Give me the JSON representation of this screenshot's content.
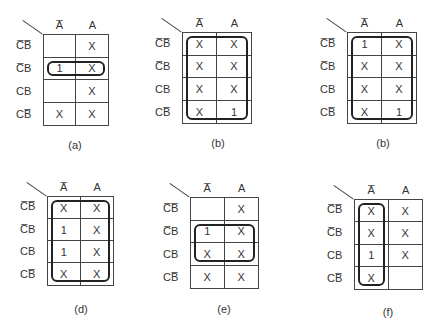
{
  "column_headers": [
    "A̅",
    "A"
  ],
  "row_headers": [
    "C̅B̅",
    "C̅B",
    "CB",
    "CB̅"
  ],
  "maps": [
    {
      "caption": "(a)",
      "cells": [
        [
          "",
          "X"
        ],
        [
          "1",
          "X"
        ],
        [
          "",
          "X"
        ],
        [
          "X",
          "X"
        ]
      ],
      "group": "row C̅B, both columns"
    },
    {
      "caption": "(b)",
      "cells": [
        [
          "X",
          "X"
        ],
        [
          "X",
          "X"
        ],
        [
          "X",
          "X"
        ],
        [
          "X",
          "1"
        ]
      ],
      "group": "all cells"
    },
    {
      "caption": "(b)",
      "cells": [
        [
          "1",
          "X"
        ],
        [
          "X",
          "X"
        ],
        [
          "X",
          "X"
        ],
        [
          "X",
          "1"
        ]
      ],
      "group": "all cells"
    },
    {
      "caption": "(d)",
      "cells": [
        [
          "X",
          "X"
        ],
        [
          "1",
          "X"
        ],
        [
          "1",
          "X"
        ],
        [
          "X",
          "X"
        ]
      ],
      "group": "all cells"
    },
    {
      "caption": "(e)",
      "cells": [
        [
          "",
          "X"
        ],
        [
          "1",
          "X"
        ],
        [
          "X",
          "X"
        ],
        [
          "X",
          "X"
        ]
      ],
      "group": "rows C̅B and CB, both columns"
    },
    {
      "caption": "(f)",
      "cells": [
        [
          "X",
          "X"
        ],
        [
          "X",
          "X"
        ],
        [
          "1",
          "X"
        ],
        [
          "X",
          ""
        ]
      ],
      "group": "column A̅, all rows"
    }
  ]
}
